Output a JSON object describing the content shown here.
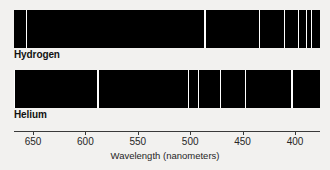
{
  "figure": {
    "axis_title": "Wavelength (nanometers)",
    "axis_ticks": [
      {
        "label": "650",
        "value": 650
      },
      {
        "label": "600",
        "value": 600
      },
      {
        "label": "550",
        "value": 550
      },
      {
        "label": "500",
        "value": 500
      },
      {
        "label": "450",
        "value": 450
      },
      {
        "label": "400",
        "value": 400
      }
    ],
    "band_background": "#000000",
    "line_color": "#ffffff",
    "page_background": "#f2f1ef"
  },
  "spectra": [
    {
      "name": "hydrogen",
      "label": "Hydrogen",
      "lines_nm": [
        656,
        486,
        434,
        410,
        397,
        389,
        384
      ]
    },
    {
      "name": "helium",
      "label": "Helium",
      "lines_nm": [
        668,
        588,
        502,
        492,
        471,
        447,
        403
      ]
    }
  ],
  "chart_data": {
    "type": "line",
    "xlabel": "Wavelength (nanometers)",
    "ylabel": "",
    "xlim": [
      672,
      380
    ],
    "xticks": [
      650,
      600,
      550,
      500,
      450,
      400
    ],
    "grid": false,
    "legend": "none",
    "series": [
      {
        "name": "Hydrogen",
        "lines_nm": [
          656,
          486,
          434,
          410,
          397,
          389,
          384
        ]
      },
      {
        "name": "Helium",
        "lines_nm": [
          668,
          588,
          502,
          492,
          471,
          447,
          403
        ]
      }
    ]
  }
}
